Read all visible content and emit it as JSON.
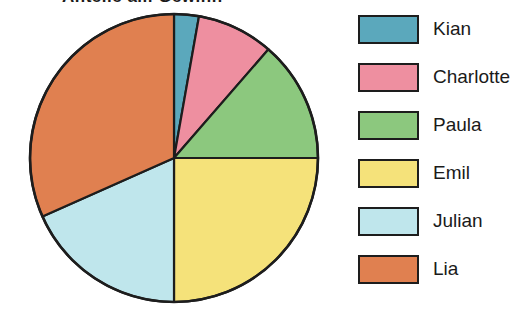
{
  "figure": {
    "title_remnant": "Anteile am Gewinn",
    "background": "#ffffff",
    "outline_color": "#1d1d1d"
  },
  "chart_data": {
    "type": "pie",
    "title": "",
    "xlabel": "",
    "ylabel": "",
    "legend_position": "right",
    "grid": false,
    "start_angle_deg": 0,
    "direction": "clockwise",
    "categories": [
      "Kian",
      "Charlotte",
      "Paula",
      "Emil",
      "Julian",
      "Lia"
    ],
    "values": [
      2.8,
      8.6,
      13.6,
      25.0,
      18.3,
      31.7
    ],
    "units": "percent",
    "angles_deg": [
      10,
      31,
      49,
      90,
      66,
      114
    ],
    "colors": [
      "#5ba8bc",
      "#ee8fa0",
      "#8cc87e",
      "#f5e27a",
      "#bfe6ec",
      "#e08050"
    ],
    "slices": [
      {
        "label": "Kian",
        "value": 2.8,
        "angle_deg": 10,
        "start_deg": 0,
        "end_deg": 10,
        "color": "#5ba8bc"
      },
      {
        "label": "Charlotte",
        "value": 8.6,
        "angle_deg": 31,
        "start_deg": 10,
        "end_deg": 41,
        "color": "#ee8fa0"
      },
      {
        "label": "Paula",
        "value": 13.6,
        "angle_deg": 49,
        "start_deg": 41,
        "end_deg": 90,
        "color": "#8cc87e"
      },
      {
        "label": "Emil",
        "value": 25.0,
        "angle_deg": 90,
        "start_deg": 90,
        "end_deg": 180,
        "color": "#f5e27a"
      },
      {
        "label": "Julian",
        "value": 18.3,
        "angle_deg": 66,
        "start_deg": 180,
        "end_deg": 246,
        "color": "#bfe6ec"
      },
      {
        "label": "Lia",
        "value": 31.7,
        "angle_deg": 114,
        "start_deg": 246,
        "end_deg": 360,
        "color": "#e08050"
      }
    ]
  },
  "legend": {
    "items": [
      {
        "label": "Kian",
        "color": "#5ba8bc"
      },
      {
        "label": "Charlotte",
        "color": "#ee8fa0"
      },
      {
        "label": "Paula",
        "color": "#8cc87e"
      },
      {
        "label": "Emil",
        "color": "#f5e27a"
      },
      {
        "label": "Julian",
        "color": "#bfe6ec"
      },
      {
        "label": "Lia",
        "color": "#e08050"
      }
    ]
  }
}
